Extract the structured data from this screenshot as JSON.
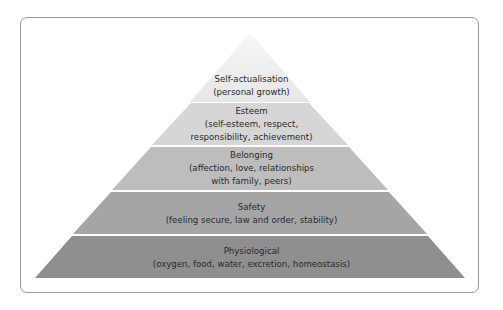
{
  "diagram": {
    "type": "pyramid",
    "levels": [
      {
        "name": "Self-actualisation",
        "detail_lines": [
          "(personal growth)"
        ],
        "color": "#e9e9e9"
      },
      {
        "name": "Esteem",
        "detail_lines": [
          "(self-esteem, respect,",
          "responsibility, achievement)"
        ],
        "color": "#d6d6d6"
      },
      {
        "name": "Belonging",
        "detail_lines": [
          "(affection, love, relationships",
          "with family, peers)"
        ],
        "color": "#bdbdbd"
      },
      {
        "name": "Safety",
        "detail_lines": [
          "(feeling secure, law and order, stability)"
        ],
        "color": "#a5a5a5"
      },
      {
        "name": "Physiological",
        "detail_lines": [
          "(oxygen, food, water, excretion, homeostasis)"
        ],
        "color": "#8f8f8f"
      }
    ]
  }
}
